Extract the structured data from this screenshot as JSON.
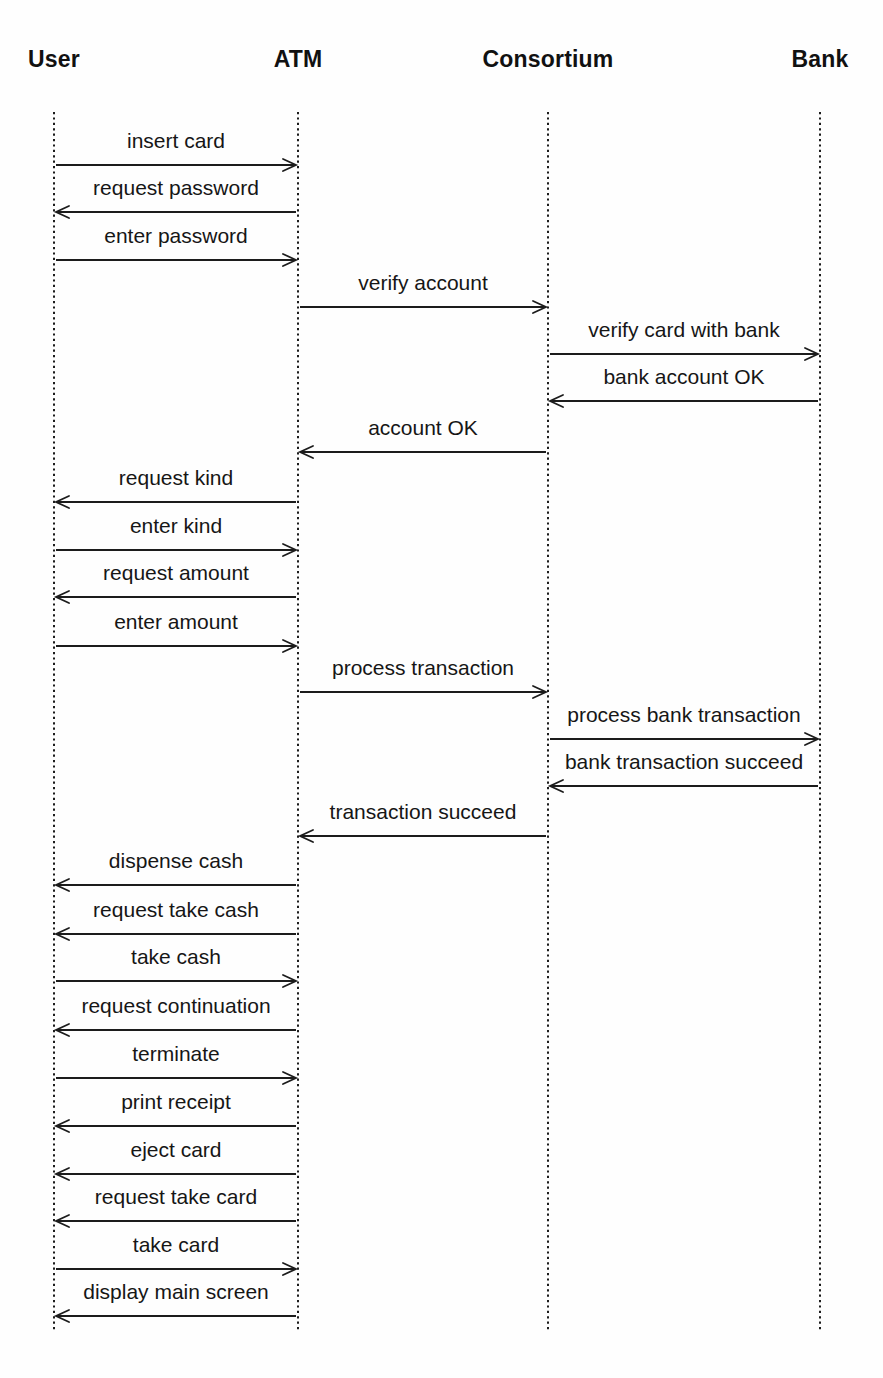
{
  "page": {
    "background_color": "#fefefe",
    "ink_color": "#1c1c1c"
  },
  "diagram": {
    "type": "uml-sequence-diagram",
    "actors": [
      {
        "id": "user",
        "label": "User",
        "x": 54
      },
      {
        "id": "atm",
        "label": "ATM",
        "x": 298
      },
      {
        "id": "consortium",
        "label": "Consortium",
        "x": 548
      },
      {
        "id": "bank",
        "label": "Bank",
        "x": 820
      }
    ],
    "lifeline": {
      "top": 112,
      "bottom": 1332
    },
    "messages": [
      {
        "label": "insert card",
        "from": "user",
        "to": "atm",
        "y": 165
      },
      {
        "label": "request password",
        "from": "atm",
        "to": "user",
        "y": 212
      },
      {
        "label": "enter password",
        "from": "user",
        "to": "atm",
        "y": 260
      },
      {
        "label": "verify account",
        "from": "atm",
        "to": "consortium",
        "y": 307
      },
      {
        "label": "verify card with bank",
        "from": "consortium",
        "to": "bank",
        "y": 354
      },
      {
        "label": "bank account OK",
        "from": "bank",
        "to": "consortium",
        "y": 401
      },
      {
        "label": "account OK",
        "from": "consortium",
        "to": "atm",
        "y": 452
      },
      {
        "label": "request kind",
        "from": "atm",
        "to": "user",
        "y": 502
      },
      {
        "label": "enter kind",
        "from": "user",
        "to": "atm",
        "y": 550
      },
      {
        "label": "request amount",
        "from": "atm",
        "to": "user",
        "y": 597
      },
      {
        "label": "enter amount",
        "from": "user",
        "to": "atm",
        "y": 646
      },
      {
        "label": "process transaction",
        "from": "atm",
        "to": "consortium",
        "y": 692
      },
      {
        "label": "process bank transaction",
        "from": "consortium",
        "to": "bank",
        "y": 739
      },
      {
        "label": "bank transaction succeed",
        "from": "bank",
        "to": "consortium",
        "y": 786
      },
      {
        "label": "transaction succeed",
        "from": "consortium",
        "to": "atm",
        "y": 836
      },
      {
        "label": "dispense cash",
        "from": "atm",
        "to": "user",
        "y": 885
      },
      {
        "label": "request take cash",
        "from": "atm",
        "to": "user",
        "y": 934
      },
      {
        "label": "take cash",
        "from": "user",
        "to": "atm",
        "y": 981
      },
      {
        "label": "request continuation",
        "from": "atm",
        "to": "user",
        "y": 1030
      },
      {
        "label": "terminate",
        "from": "user",
        "to": "atm",
        "y": 1078
      },
      {
        "label": "print receipt",
        "from": "atm",
        "to": "user",
        "y": 1126
      },
      {
        "label": "eject card",
        "from": "atm",
        "to": "user",
        "y": 1174
      },
      {
        "label": "request take card",
        "from": "atm",
        "to": "user",
        "y": 1221
      },
      {
        "label": "take card",
        "from": "user",
        "to": "atm",
        "y": 1269
      },
      {
        "label": "display main screen",
        "from": "atm",
        "to": "user",
        "y": 1316
      }
    ]
  }
}
